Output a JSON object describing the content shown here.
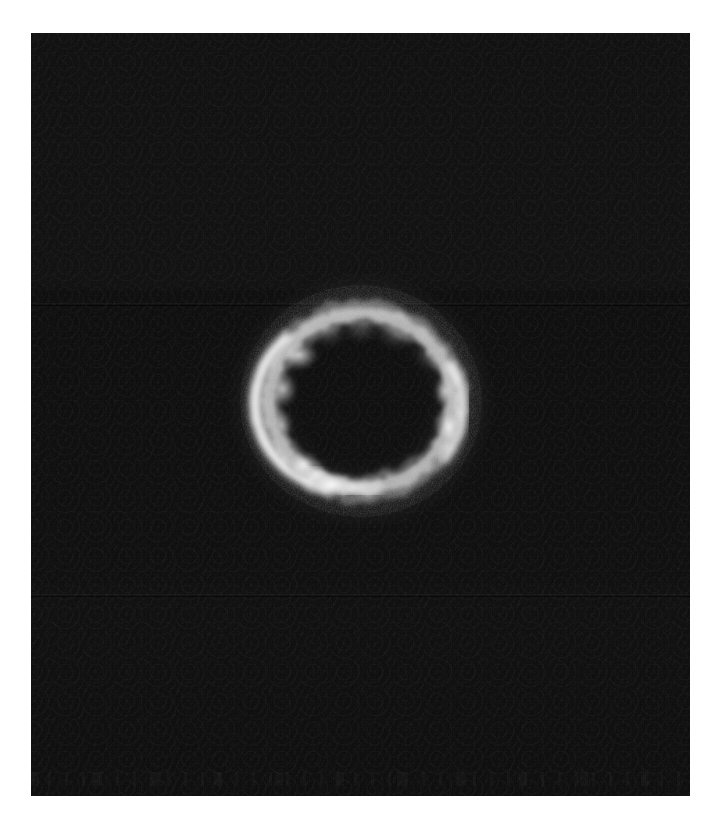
{
  "figure": {
    "kind": "astronomical-image",
    "caption": "",
    "colormap": "grayscale",
    "background_color": "#0a0a0a",
    "panel": {
      "x": 31,
      "y": 33,
      "width": 659,
      "height": 763,
      "border_color": "#000000"
    },
    "margin_color": "#ffffff"
  },
  "chart_data": {
    "type": "heatmap",
    "title": "",
    "subtitle": "",
    "xlabel": "",
    "ylabel": "",
    "colormap": "grayscale",
    "grid": false,
    "legend": "none",
    "tick_labels": {
      "x": [],
      "y": []
    },
    "annotations": [],
    "background_level": 0.04,
    "peak_level": 1.0,
    "structure": "einstein-ring",
    "ring": {
      "center_x": 330,
      "center_y": 368,
      "radius_x": 92,
      "radius_y": 87,
      "thickness": 17,
      "description": "near-complete bright ring with clumpy knots; brightest along the west and southwest limb, a secondary bright knot on the east limb, diffuse emission to the north and southeast"
    },
    "knots": [
      {
        "name": "nw-knot",
        "angle_deg": 143,
        "brightness": 0.92,
        "size": 26
      },
      {
        "name": "w-arc",
        "angle_deg": 178,
        "brightness": 0.86,
        "size": 34
      },
      {
        "name": "sw-arc",
        "angle_deg": 218,
        "brightness": 0.98,
        "size": 40
      },
      {
        "name": "s-knot",
        "angle_deg": 252,
        "brightness": 0.55,
        "size": 24
      },
      {
        "name": "se-diffuse",
        "angle_deg": 300,
        "brightness": 0.4,
        "size": 30
      },
      {
        "name": "e-knot",
        "angle_deg": 348,
        "brightness": 0.9,
        "size": 30
      },
      {
        "name": "ne-knot",
        "angle_deg": 28,
        "brightness": 0.58,
        "size": 26
      },
      {
        "name": "n-diffuse",
        "angle_deg": 72,
        "brightness": 0.62,
        "size": 32
      }
    ]
  }
}
